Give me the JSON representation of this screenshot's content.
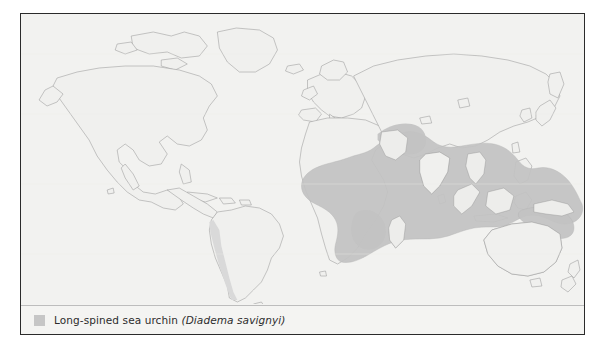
{
  "figure": {
    "kind": "species-distribution-map",
    "projection_note": "world map, equirectangular"
  },
  "map": {
    "name": "world-distribution-map",
    "ocean_color": "#f2f2f0",
    "land_color": "#f0f0ee",
    "coastline_color": "#9a9a9a",
    "range_color": "#c2c2c2",
    "relief_color": "#d8d8d8",
    "landmasses": [
      "North America",
      "South America",
      "Greenland",
      "Europe",
      "Africa",
      "Asia",
      "Australia",
      "New Zealand",
      "Japan",
      "Madagascar",
      "Indonesia",
      "Philippines",
      "New Guinea"
    ]
  },
  "legend": {
    "swatch_color": "#c6c6c6",
    "common_name": "Long-spined sea urchin",
    "scientific_name": "(Diadema savignyi)"
  },
  "range": {
    "label": "Indo-Pacific distribution",
    "regions": [
      "East Africa",
      "Madagascar",
      "Red Sea",
      "Arabian Sea",
      "Indian Ocean",
      "Bay of Bengal",
      "Southeast Asia",
      "Indonesia",
      "Philippines",
      "Coral Sea",
      "Western Pacific islands"
    ]
  }
}
